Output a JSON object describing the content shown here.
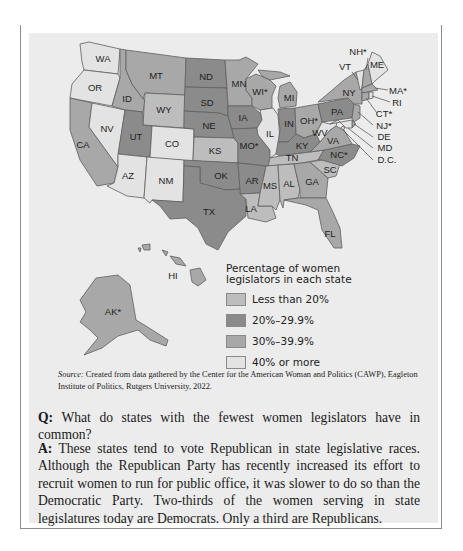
{
  "legend": {
    "title": "Percentage of women legislators in each state",
    "items": [
      {
        "key": "lt20",
        "label": "Less than 20%",
        "color": "#bdbdbd"
      },
      {
        "key": "20to30",
        "label": "20%–29.9%",
        "color": "#8b8b8b"
      },
      {
        "key": "30to40",
        "label": "30%–39.9%",
        "color": "#a8a8a8"
      },
      {
        "key": "ge40",
        "label": "40% or more",
        "color": "#e3e3e3"
      }
    ]
  },
  "states": {
    "WA": {
      "label": "WA",
      "cat": "ge40"
    },
    "OR": {
      "label": "OR",
      "cat": "ge40"
    },
    "CA": {
      "label": "CA",
      "cat": "30to40"
    },
    "NV": {
      "label": "NV",
      "cat": "ge40"
    },
    "ID": {
      "label": "ID",
      "cat": "30to40"
    },
    "MT": {
      "label": "MT",
      "cat": "30to40"
    },
    "WY": {
      "label": "WY",
      "cat": "lt20"
    },
    "UT": {
      "label": "UT",
      "cat": "20to30"
    },
    "AZ": {
      "label": "AZ",
      "cat": "ge40"
    },
    "CO": {
      "label": "CO",
      "cat": "ge40"
    },
    "NM": {
      "label": "NM",
      "cat": "ge40"
    },
    "ND": {
      "label": "ND",
      "cat": "20to30"
    },
    "SD": {
      "label": "SD",
      "cat": "20to30"
    },
    "NE": {
      "label": "NE",
      "cat": "20to30"
    },
    "KS": {
      "label": "KS",
      "cat": "lt20"
    },
    "OK": {
      "label": "OK",
      "cat": "20to30"
    },
    "TX": {
      "label": "TX",
      "cat": "20to30"
    },
    "MN": {
      "label": "MN",
      "cat": "30to40"
    },
    "IA": {
      "label": "IA",
      "cat": "20to30"
    },
    "MO": {
      "label": "MO*",
      "cat": "20to30"
    },
    "AR": {
      "label": "AR",
      "cat": "20to30"
    },
    "LA": {
      "label": "LA",
      "cat": "lt20"
    },
    "WI": {
      "label": "WI*",
      "cat": "30to40"
    },
    "IL": {
      "label": "IL",
      "cat": "ge40"
    },
    "MI": {
      "label": "MI",
      "cat": "30to40"
    },
    "IN": {
      "label": "IN",
      "cat": "20to30"
    },
    "OH": {
      "label": "OH*",
      "cat": "30to40"
    },
    "KY": {
      "label": "KY",
      "cat": "20to30"
    },
    "TN": {
      "label": "TN",
      "cat": "lt20"
    },
    "MS": {
      "label": "MS",
      "cat": "lt20"
    },
    "AL": {
      "label": "AL",
      "cat": "lt20"
    },
    "GA": {
      "label": "GA",
      "cat": "30to40"
    },
    "FL": {
      "label": "FL",
      "cat": "30to40"
    },
    "SC": {
      "label": "SC",
      "cat": "lt20"
    },
    "NC": {
      "label": "NC*",
      "cat": "20to30"
    },
    "VA": {
      "label": "VA",
      "cat": "30to40"
    },
    "WV": {
      "label": "WV",
      "cat": "ge40"
    },
    "PA": {
      "label": "PA",
      "cat": "20to30"
    },
    "NY": {
      "label": "NY",
      "cat": "30to40"
    },
    "VT": {
      "label": "VT",
      "cat": "ge40"
    },
    "NH": {
      "label": "NH*",
      "cat": "30to40"
    },
    "ME": {
      "label": "ME",
      "cat": "ge40"
    },
    "MA": {
      "label": "MA*",
      "cat": "30to40"
    },
    "RI": {
      "label": "RI",
      "cat": "ge40"
    },
    "CT": {
      "label": "CT*",
      "cat": "30to40"
    },
    "NJ": {
      "label": "NJ*",
      "cat": "30to40"
    },
    "DE": {
      "label": "DE",
      "cat": "30to40"
    },
    "MD": {
      "label": "MD",
      "cat": "ge40"
    },
    "DC": {
      "label": "D.C.",
      "cat": "ge40"
    },
    "AK": {
      "label": "AK*",
      "cat": "30to40"
    },
    "HI": {
      "label": "HI",
      "cat": "30to40"
    }
  },
  "source": {
    "prefix": "Source:",
    "text": " Created from data gathered by the Center for the American Woman and Politics (CAWP), Eagleton Institute of Politics, Rutgers University, 2022."
  },
  "qa": {
    "q_prefix": "Q:",
    "q_text": " What do states with the fewest women legislators have in common?",
    "a_prefix": "A:",
    "a_text": " These states tend to vote Republican in state legislative races. Although the Republican Party has recently increased its effort to recruit women to run for public office, it was slower to do so than the Democratic Party. Two-thirds of the women serving in state legislatures today are Democrats. Only a third are Republicans."
  }
}
